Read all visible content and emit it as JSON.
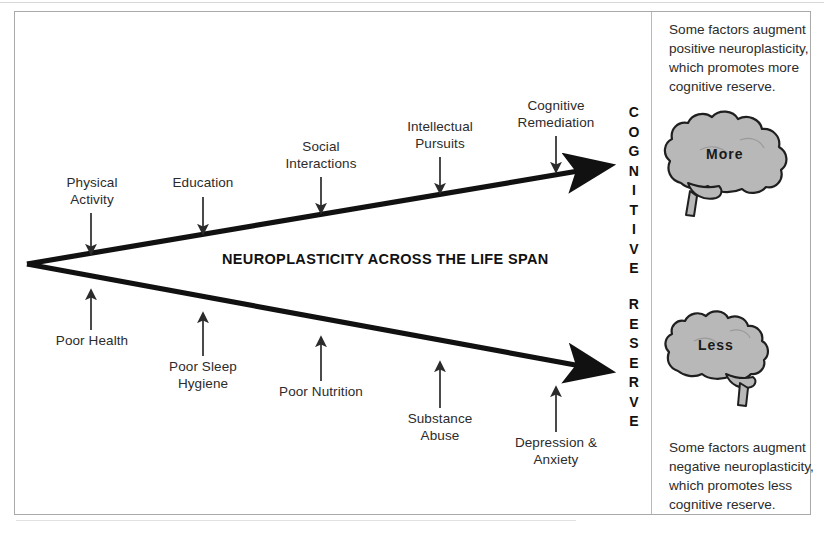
{
  "figure": {
    "center_title": "NEUROPLASTICITY ACROSS THE LIFE SPAN",
    "axis_word_top": "COGNITIVE",
    "axis_word_bottom": "RESERVE",
    "axis_letters_top": [
      "C",
      "O",
      "G",
      "N",
      "I",
      "T",
      "I",
      "V",
      "E"
    ],
    "axis_letters_bottom": [
      "R",
      "E",
      "S",
      "E",
      "R",
      "V",
      "E"
    ]
  },
  "positive_factors": [
    {
      "label": "Physical\nActivity"
    },
    {
      "label": "Education"
    },
    {
      "label": "Social\nInteractions"
    },
    {
      "label": "Intellectual\nPursuits"
    },
    {
      "label": "Cognitive\nRemediation"
    }
  ],
  "negative_factors": [
    {
      "label": "Poor Health"
    },
    {
      "label": "Poor Sleep\nHygiene"
    },
    {
      "label": "Poor Nutrition"
    },
    {
      "label": "Substance\nAbuse"
    },
    {
      "label": "Depression &\nAnxiety"
    }
  ],
  "side_notes": {
    "top": "Some factors augment positive neuroplasticity, which promotes more cognitive reserve.",
    "bottom": "Some factors augment negative neuroplasticity, which promotes less cognitive reserve."
  },
  "brains": {
    "top_label": "More",
    "bottom_label": "Less"
  },
  "colors": {
    "brain_fill": "#b8b8b8",
    "brain_stroke": "#1f1f1f",
    "arrow": "#111111",
    "text": "#2b2b2b",
    "frame": "#a9a9a9"
  }
}
